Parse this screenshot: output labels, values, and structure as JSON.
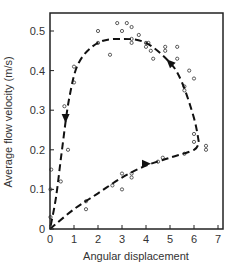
{
  "chart_data": {
    "type": "scatter",
    "title": "",
    "xlabel": "Angular displacement",
    "ylabel": "Average flow velocity (m/s)",
    "xlim": [
      0,
      7
    ],
    "ylim": [
      0,
      0.55
    ],
    "xticks": [
      0,
      1,
      2,
      3,
      4,
      5,
      6,
      7
    ],
    "yticks": [
      0,
      0.1,
      0.2,
      0.3,
      0.4,
      0.5
    ],
    "ytick_labels": [
      "0",
      "0.1",
      "0.2",
      "0.3",
      "0.4",
      "0.5"
    ],
    "grid": false,
    "legend": null,
    "series": [
      {
        "name": "measured points",
        "style": "open-circle",
        "points": [
          [
            0.02,
            0.03
          ],
          [
            0.02,
            0.1
          ],
          [
            0.05,
            0.15
          ],
          [
            0.45,
            0.12
          ],
          [
            0.75,
            0.2
          ],
          [
            1.5,
            0.07
          ],
          [
            1.5,
            0.05
          ],
          [
            2.6,
            0.11
          ],
          [
            3.0,
            0.14
          ],
          [
            3.0,
            0.1
          ],
          [
            3.4,
            0.13
          ],
          [
            3.4,
            0.14
          ],
          [
            4.5,
            0.17
          ],
          [
            4.7,
            0.18
          ],
          [
            5.6,
            0.19
          ],
          [
            6.0,
            0.22
          ],
          [
            6.0,
            0.24
          ],
          [
            6.5,
            0.2
          ],
          [
            6.5,
            0.21
          ],
          [
            0.6,
            0.31
          ],
          [
            1.0,
            0.37
          ],
          [
            1.0,
            0.41
          ],
          [
            2.0,
            0.47
          ],
          [
            2.0,
            0.5
          ],
          [
            2.5,
            0.44
          ],
          [
            2.8,
            0.52
          ],
          [
            3.0,
            0.5
          ],
          [
            3.2,
            0.52
          ],
          [
            3.4,
            0.51
          ],
          [
            3.4,
            0.48
          ],
          [
            4.1,
            0.47
          ],
          [
            4.2,
            0.45
          ],
          [
            4.3,
            0.43
          ],
          [
            4.8,
            0.46
          ],
          [
            4.8,
            0.45
          ],
          [
            5.3,
            0.46
          ],
          [
            5.3,
            0.43
          ],
          [
            5.8,
            0.4
          ],
          [
            6.0,
            0.38
          ],
          [
            3.4,
            0.47
          ],
          [
            3.7,
            0.49
          ],
          [
            4.0,
            0.46
          ],
          [
            4.0,
            0.47
          ],
          [
            5.6,
            0.35
          ],
          [
            5.6,
            0.36
          ]
        ]
      },
      {
        "name": "loop path (outbound, increasing displacement)",
        "style": "dashed-line",
        "points": [
          [
            0,
            0
          ],
          [
            1,
            0.05
          ],
          [
            2,
            0.09
          ],
          [
            3,
            0.13
          ],
          [
            4,
            0.16
          ],
          [
            5,
            0.18
          ],
          [
            6,
            0.2
          ],
          [
            6.2,
            0.22
          ]
        ]
      },
      {
        "name": "loop path (return, decreasing displacement)",
        "style": "dashed-line",
        "points": [
          [
            6.2,
            0.22
          ],
          [
            6.0,
            0.28
          ],
          [
            5.5,
            0.37
          ],
          [
            5.0,
            0.42
          ],
          [
            4.0,
            0.47
          ],
          [
            3.0,
            0.48
          ],
          [
            2.0,
            0.47
          ],
          [
            1.2,
            0.42
          ],
          [
            0.8,
            0.33
          ],
          [
            0.5,
            0.2
          ],
          [
            0.25,
            0.08
          ],
          [
            0,
            0
          ]
        ]
      }
    ],
    "annotations": [
      {
        "type": "arrow",
        "at": [
          4.0,
          0.165
        ],
        "direction": "right"
      },
      {
        "type": "arrow",
        "at": [
          5.0,
          0.42
        ],
        "direction": "up-left"
      },
      {
        "type": "arrow",
        "at": [
          0.65,
          0.28
        ],
        "direction": "down"
      }
    ]
  }
}
